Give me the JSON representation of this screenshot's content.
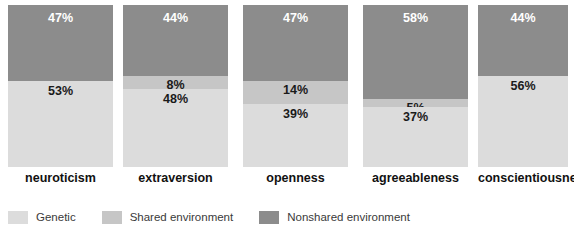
{
  "chart_data": {
    "type": "bar",
    "subtype": "stacked-bar-100",
    "title": "",
    "subtitle": "",
    "xlabel": "",
    "ylabel": "",
    "ylim": [
      0,
      100
    ],
    "grid": false,
    "legend_position": "bottom-left",
    "categories": [
      "neuroticism",
      "extraversion",
      "openness",
      "agreeableness",
      "conscientiousness"
    ],
    "series": [
      {
        "name": "Genetic",
        "color": "#dcdcdc",
        "values": [
          53,
          48,
          39,
          37,
          56
        ],
        "labels": [
          "53%",
          "48%",
          "39%",
          "37%",
          "56%"
        ]
      },
      {
        "name": "Shared environment",
        "color": "#c6c6c6",
        "values": [
          0,
          8,
          14,
          5,
          0
        ],
        "labels": [
          "",
          "8%",
          "14%",
          "5%",
          ""
        ]
      },
      {
        "name": "Nonshared environment",
        "color": "#8c8c8c",
        "values": [
          47,
          44,
          47,
          58,
          44
        ],
        "labels": [
          "47%",
          "44%",
          "47%",
          "58%",
          "44%"
        ]
      }
    ]
  },
  "legend": {
    "items": [
      {
        "label": "Genetic",
        "color": "#dcdcdc"
      },
      {
        "label": "Shared environment",
        "color": "#c6c6c6"
      },
      {
        "label": "Nonshared environment",
        "color": "#8c8c8c"
      }
    ]
  },
  "bars": [
    {
      "category": "neuroticism",
      "x": 8,
      "width": 105,
      "genetic_label": "53%",
      "shared_label": "",
      "nonshared_label": "47%",
      "genetic_pct": 53,
      "shared_pct": 0,
      "nonshared_pct": 47
    },
    {
      "category": "extraversion",
      "x": 123,
      "width": 105,
      "genetic_label": "48%",
      "shared_label": "8%",
      "nonshared_label": "44%",
      "genetic_pct": 48,
      "shared_pct": 8,
      "nonshared_pct": 44
    },
    {
      "category": "openness",
      "x": 243,
      "width": 105,
      "genetic_label": "39%",
      "shared_label": "14%",
      "nonshared_label": "47%",
      "genetic_pct": 39,
      "shared_pct": 14,
      "nonshared_pct": 47
    },
    {
      "category": "agreeableness",
      "x": 363,
      "width": 105,
      "genetic_label": "37%",
      "shared_label": "5%",
      "nonshared_label": "58%",
      "genetic_pct": 37,
      "shared_pct": 5,
      "nonshared_pct": 58
    },
    {
      "category": "conscientiousness",
      "x": 478,
      "width": 90,
      "genetic_label": "56%",
      "shared_label": "",
      "nonshared_label": "44%",
      "genetic_pct": 56,
      "shared_pct": 0,
      "nonshared_pct": 44
    }
  ],
  "colors": {
    "genetic": "#dcdcdc",
    "shared": "#c6c6c6",
    "nonshared": "#8c8c8c",
    "background": "#ffffff",
    "label_dark": "#111111",
    "label_light": "#ffffff"
  }
}
